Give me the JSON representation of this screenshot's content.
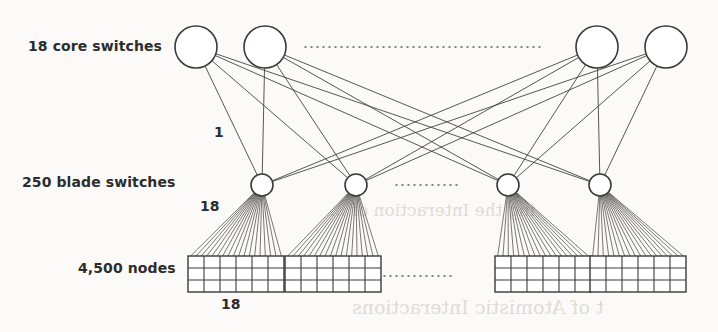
{
  "figure": {
    "background_color": "#fbfaf8",
    "ink_color": "#3a3a3a"
  },
  "labels": {
    "core_row": "18 core switches",
    "blade_row": "250 blade switches",
    "nodes_row": "4,500 nodes",
    "uplink_count": "1",
    "fanout_count": "18",
    "grid_width": "18"
  },
  "ghost_text": {
    "line_1": "ing the Interaction of ...",
    "line_2": "t of Atomistic Interactions"
  },
  "chart_data": {
    "type": "diagram",
    "diagram_kind": "network-topology",
    "tiers": [
      {
        "name": "core",
        "label": "18 core switches",
        "count": 18,
        "shown": 4,
        "shape": "circle",
        "radius": 21,
        "center_y": 47,
        "x_positions": [
          196,
          265,
          597,
          666
        ],
        "ellipsis": {
          "x_start": 305,
          "x_end": 541,
          "y": 47
        }
      },
      {
        "name": "blade",
        "label": "250 blade switches",
        "count": 250,
        "shown": 4,
        "shape": "circle",
        "radius": 11,
        "center_y": 185,
        "x_positions": [
          262,
          356,
          508,
          600
        ],
        "ellipsis": {
          "x_start": 396,
          "x_end": 462,
          "y": 185
        }
      },
      {
        "name": "nodes",
        "label": "4,500 nodes",
        "count": 4500,
        "shown": 4,
        "shape": "grid",
        "grid_cols": 6,
        "grid_rows": 3,
        "cell_w": 16,
        "cell_h": 12,
        "top_y": 256,
        "x_left_positions": [
          188,
          285,
          495,
          590
        ],
        "ellipsis": {
          "x_start": 372,
          "x_end": 452,
          "y": 276
        }
      }
    ],
    "links": {
      "core_to_blade": {
        "pattern": "full-bipartite",
        "per_link_cables": 1,
        "label": "1",
        "label_pos": {
          "x": 221,
          "y": 134
        }
      },
      "blade_to_nodes": {
        "pattern": "fan",
        "cables_per_blade": 18,
        "label": "18",
        "label_pos": {
          "x": 208,
          "y": 206
        }
      },
      "grid_width_label": {
        "value": "18",
        "label_pos": {
          "x": 229,
          "y": 304
        }
      }
    }
  }
}
